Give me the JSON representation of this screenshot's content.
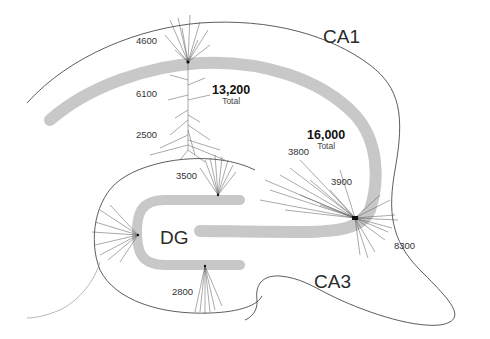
{
  "diagram": {
    "regions": {
      "ca1": "CA1",
      "ca3": "CA3",
      "dg": "DG"
    },
    "ca1_neuron": {
      "counts": {
        "apical_tuft": "4600",
        "apical_oblique": "6100",
        "basal": "2500"
      },
      "total_value": "13,200",
      "total_label": "Total"
    },
    "ca3_neuron": {
      "counts": {
        "apical_distal": "3800",
        "apical_proximal": "3900",
        "basal": "8300"
      },
      "total_value": "16,000",
      "total_label": "Total"
    },
    "dg_neurons": {
      "counts": {
        "upper_blade": "3500",
        "lower_blade": "2800"
      }
    },
    "colors": {
      "cell_layer": "#c8c8c8",
      "outline": "#333333",
      "dendrite": "#555555",
      "background": "#ffffff"
    }
  }
}
